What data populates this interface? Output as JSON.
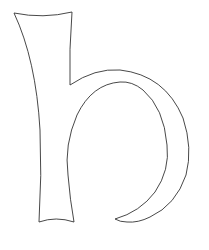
{
  "figure": {
    "letter": "h",
    "stroke_color": "#333333",
    "background_color": "#ffffff"
  }
}
